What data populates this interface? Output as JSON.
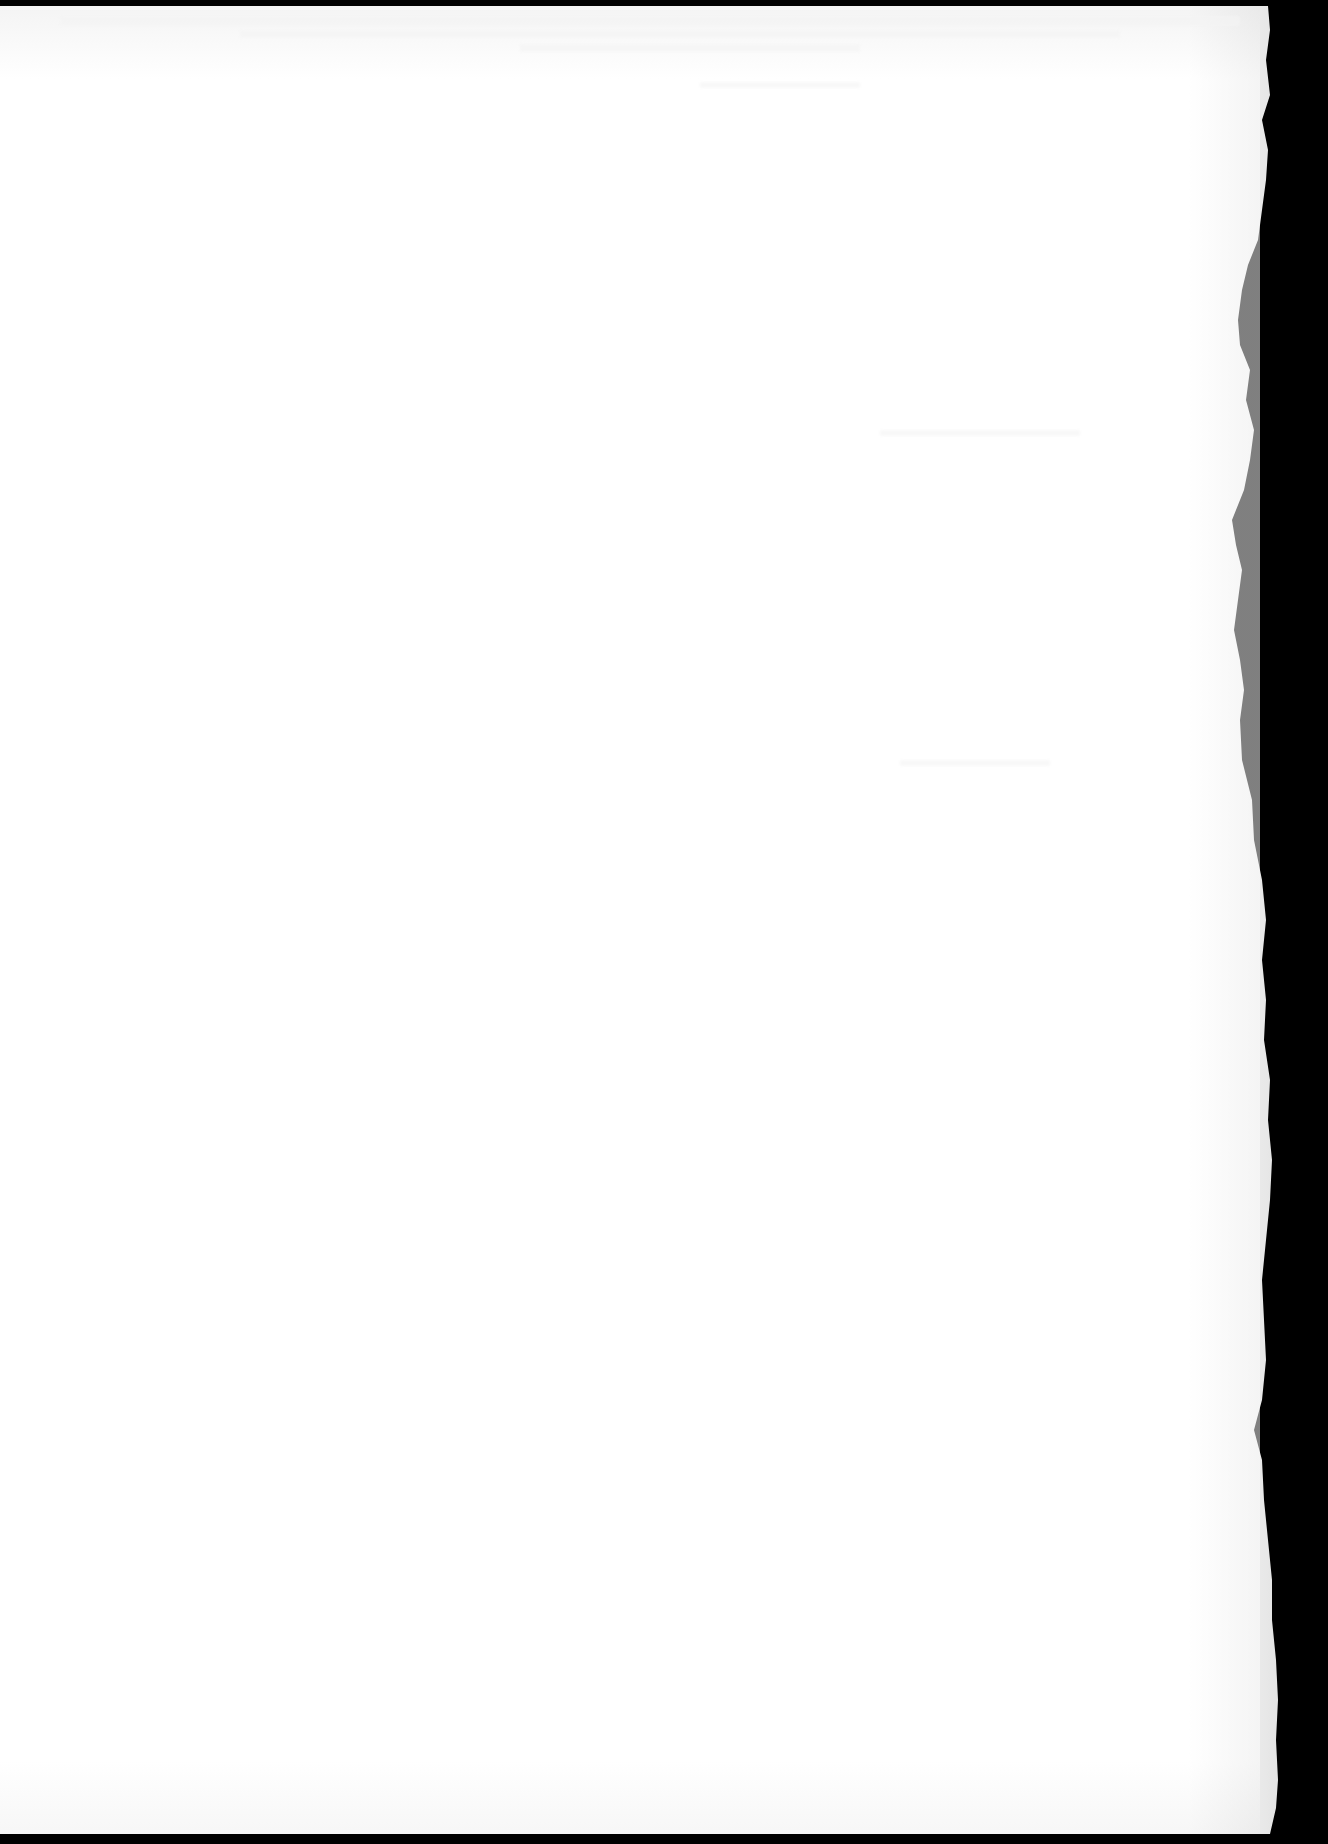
{
  "page": {
    "type": "scanned-blank-sheet",
    "paper_color": "#ffffff",
    "background_color": "#000000",
    "edge_shadow_color": "#e6e6e6",
    "bleed_color": "#ececec",
    "text_content": []
  }
}
